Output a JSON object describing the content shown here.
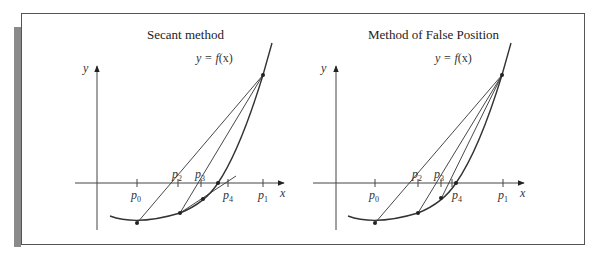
{
  "figure": {
    "panels": [
      {
        "title": "Secant method",
        "y_axis_label": "y",
        "x_axis_label": "x",
        "curve_label": "y = f(x)",
        "points": [
          "p0",
          "p1",
          "p2",
          "p3",
          "p4"
        ]
      },
      {
        "title": "Method of False Position",
        "y_axis_label": "y",
        "x_axis_label": "x",
        "curve_label": "y = f(x)",
        "points": [
          "p0",
          "p1",
          "p2",
          "p3",
          "p4"
        ]
      }
    ]
  },
  "labels": {
    "left_title": "Secant method",
    "right_title": "Method of False Position",
    "y": "y",
    "x": "x",
    "curve_lhs": "y = ",
    "curve_f": "f",
    "curve_arg": "(x)",
    "p": "p",
    "s0": "0",
    "s1": "1",
    "s2": "2",
    "s3": "3",
    "s4": "4"
  },
  "colors": {
    "line": "#333333",
    "frame": "#555555",
    "sidebar": "#8a8a8a"
  }
}
